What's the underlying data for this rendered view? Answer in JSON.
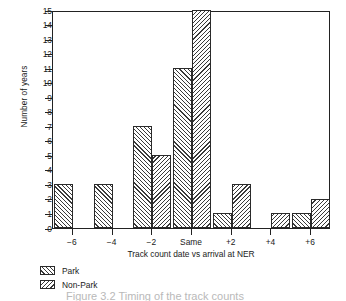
{
  "chart_data": {
    "type": "bar",
    "title": "",
    "xlabel": "Track count date vs arrival at NER",
    "ylabel": "Number of years",
    "categories": [
      "−6",
      "−4",
      "−2",
      "Same",
      "+2",
      "+4",
      "+6"
    ],
    "series": [
      {
        "name": "Park",
        "values": [
          3,
          3,
          7,
          11,
          1,
          0,
          1
        ]
      },
      {
        "name": "Non-Park",
        "values": [
          0,
          0,
          5,
          15,
          3,
          1,
          2
        ]
      }
    ],
    "ylim": [
      0,
      15
    ],
    "yticks": [
      0,
      1,
      2,
      3,
      4,
      5,
      6,
      7,
      8,
      9,
      10,
      11,
      12,
      13,
      14,
      15
    ],
    "ytick_labels": [
      "0",
      "1",
      "2",
      "3",
      "4",
      "5",
      "6",
      "7",
      "8",
      "9",
      "10",
      "11",
      "12",
      "13",
      "14",
      "15"
    ],
    "grid": false,
    "legend_position": "below-left",
    "colors": {
      "line": "#222222",
      "hatch": "#3a3a3a",
      "background": "#ffffff"
    }
  },
  "legend": {
    "items": [
      {
        "label": "Park",
        "pattern": "forward-hatch-icon"
      },
      {
        "label": "Non-Park",
        "pattern": "backward-hatch-icon"
      }
    ]
  },
  "caption": {
    "text": "Figure 3.2 Timing of the track counts"
  }
}
